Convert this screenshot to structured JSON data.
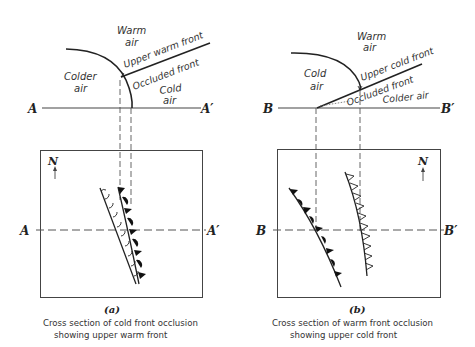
{
  "panels": [
    {
      "id": "a",
      "letter": "(a)",
      "caption_line1": "Cross section of cold front occlusion",
      "caption_line2": "showing upper warm front",
      "section_start": "A",
      "section_end": "A′",
      "north_label": "N",
      "air_labels": {
        "top_word1": "Warm",
        "top_word2": "air",
        "left_word1": "Colder",
        "left_word2": "air",
        "right_word1": "Cold",
        "right_word2": "air"
      },
      "front_labels": {
        "upper": "Upper warm front",
        "occluded": "Occluded front"
      },
      "map_fronts": [
        "warm front (open semicircles)",
        "cold front (filled triangles + semicircles)"
      ]
    },
    {
      "id": "b",
      "letter": "(b)",
      "caption_line1": "Cross section of warm front occlusion",
      "caption_line2": "showing upper cold front",
      "section_start": "B",
      "section_end": "B′",
      "north_label": "N",
      "air_labels": {
        "top_word1": "Warm",
        "top_word2": "air",
        "left_word1": "Cold",
        "left_word2": "air",
        "right": "Colder air"
      },
      "front_labels": {
        "upper": "Upper cold front",
        "occluded": "Occluded front"
      },
      "map_fronts": [
        "occluded front (filled triangles + semicircles)",
        "upper cold front (open triangles)"
      ]
    }
  ],
  "colors": {
    "line": "#222222",
    "text": "#333333",
    "background": "#ffffff"
  }
}
